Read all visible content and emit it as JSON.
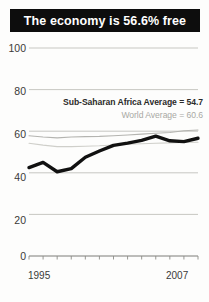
{
  "title": "The economy is 56.6% free",
  "annotations": {
    "ssa": "Sub-Saharan Africa Average = 54.7",
    "world": "World Average = 60.6"
  },
  "colors": {
    "banner_bg": "#0d0d0d",
    "banner_text": "#ffffff",
    "main_line": "#111111",
    "world_line": "#b4b4b0",
    "ssa_line": "#cfcfca",
    "grid": "#b9b9b4",
    "tick_text": "#3a3a38"
  },
  "chart_data": {
    "type": "line",
    "title": "The economy is 56.6% free",
    "xlabel": "",
    "ylabel": "",
    "ylim": [
      0,
      100
    ],
    "yticks": [
      0,
      20,
      40,
      60,
      80,
      100
    ],
    "ytick_labels": [
      "0",
      "20",
      "40",
      "60",
      "80",
      "100"
    ],
    "xlim": [
      1995,
      2007
    ],
    "xticks": [
      1995,
      1996,
      1997,
      1998,
      1999,
      2000,
      2001,
      2002,
      2003,
      2004,
      2005,
      2006,
      2007
    ],
    "xtick_labels_shown": [
      "1995",
      "2007"
    ],
    "grid": true,
    "legend": "none",
    "x": [
      1995,
      1996,
      1997,
      1998,
      1999,
      2000,
      2001,
      2002,
      2003,
      2004,
      2005,
      2006,
      2007
    ],
    "series": [
      {
        "name": "Economic Freedom Score",
        "color": "#111111",
        "width": 3.4,
        "values": [
          42.5,
          45.0,
          40.5,
          42.0,
          47.5,
          50.5,
          53.2,
          54.3,
          55.6,
          57.6,
          55.4,
          55.0,
          56.6
        ]
      },
      {
        "name": "World Average = 60.6",
        "color": "#b4b4b0",
        "width": 1.1,
        "values": [
          57.8,
          57.2,
          56.8,
          57.2,
          57.4,
          57.5,
          57.8,
          58.2,
          58.6,
          59.0,
          59.4,
          60.2,
          60.6
        ]
      },
      {
        "name": "Sub-Saharan Africa Average = 54.7",
        "color": "#cfcfca",
        "width": 1.1,
        "values": [
          54.2,
          53.3,
          52.6,
          52.6,
          52.8,
          53.0,
          53.4,
          53.7,
          54.0,
          54.2,
          54.4,
          54.6,
          54.7
        ]
      }
    ],
    "annotations": [
      {
        "text": "Sub-Saharan Africa Average = 54.7",
        "value": 54.7
      },
      {
        "text": "World Average = 60.6",
        "value": 60.6
      }
    ]
  },
  "yaxis": {
    "ticks": [
      {
        "label": "100"
      },
      {
        "label": "80"
      },
      {
        "label": "60"
      },
      {
        "label": "40"
      },
      {
        "label": "20"
      },
      {
        "label": "0"
      }
    ]
  },
  "xaxis": {
    "start_label": "1995",
    "end_label": "2007"
  }
}
